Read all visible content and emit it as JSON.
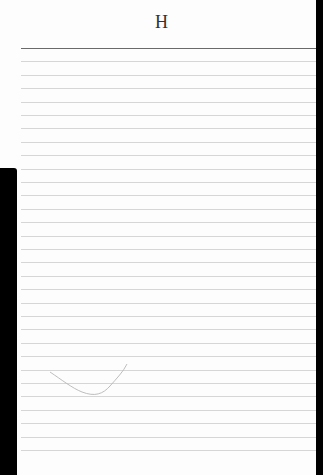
{
  "page": {
    "header_letter": "H",
    "ruled_lines_count": 31,
    "top_rule_y": 48,
    "line_spacing_px": 13.4,
    "colors": {
      "paper": "#fdfdfd",
      "top_rule": "#6a6a6a",
      "rule": "#d6d6d6",
      "edge": "#000000",
      "pencil": "#b5b5b5"
    }
  }
}
